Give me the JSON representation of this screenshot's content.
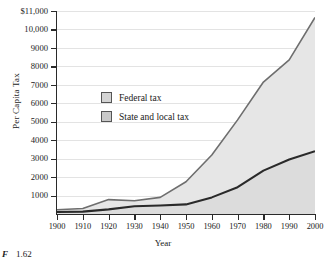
{
  "chart_data": {
    "type": "area",
    "title": "",
    "xlabel": "Year",
    "ylabel": "Per Capita Tax",
    "xlim": [
      1900,
      2000
    ],
    "ylim": [
      0,
      11000
    ],
    "grid": true,
    "legend_position": "inside-left",
    "x": [
      1900,
      1910,
      1920,
      1930,
      1940,
      1950,
      1960,
      1970,
      1980,
      1990,
      2000
    ],
    "xticklabels": [
      "1900",
      "1910",
      "1920",
      "1930",
      "1940",
      "1950",
      "1960",
      "1970",
      "1980",
      "1990",
      "2000"
    ],
    "yticks": [
      1000,
      2000,
      3000,
      4000,
      5000,
      6000,
      7000,
      8000,
      9000,
      10000,
      11000
    ],
    "yticklabels": [
      "1000",
      "2000",
      "3000",
      "4000",
      "5000",
      "6000",
      "7000",
      "8000",
      "9000",
      "10,000",
      "$11,000"
    ],
    "series": [
      {
        "name": "State and local tax",
        "values": [
          110,
          130,
          250,
          420,
          460,
          520,
          900,
          1450,
          2350,
          2950,
          3400
        ],
        "color": "#2a2a2a",
        "fill": "#dcdcdc"
      },
      {
        "name": "Federal tax",
        "values": [
          230,
          300,
          780,
          720,
          900,
          1750,
          3200,
          5100,
          7150,
          8350,
          10650
        ],
        "color": "#6e6e6e",
        "fill": "#e6e6e6"
      }
    ],
    "colors": {
      "axis": "#2a2a2a",
      "grid": "#e3e3e3",
      "federal_line": "#6e6e6e",
      "state_line": "#2a2a2a",
      "federal_fill": "#e6e6e6",
      "state_fill": "#dcdcdc",
      "legend_swatch": "#d4d4d4"
    }
  },
  "legend": {
    "items": [
      {
        "label": "Federal tax"
      },
      {
        "label": "State and local tax"
      }
    ]
  },
  "caption": {
    "figure": "F",
    "number": "1.62"
  }
}
